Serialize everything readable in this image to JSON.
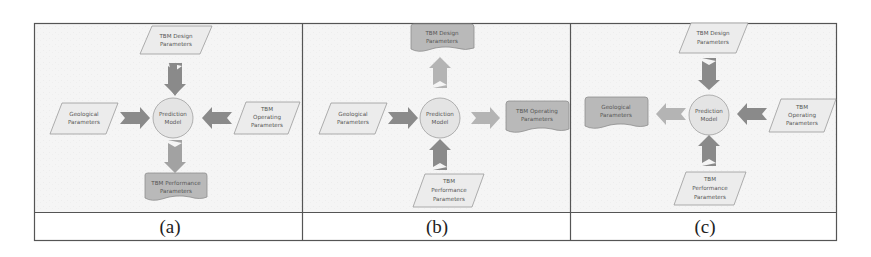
{
  "figure": {
    "colors": {
      "panel_bg": "#f4f4f4",
      "border": "#555555",
      "input_fill": "#ececec",
      "input_stroke": "#9a9a9a",
      "output_fill": "#b9b9b9",
      "output_stroke": "#8e8e8e",
      "circle_fill": "#e4e4e4",
      "arrow_in": "#8a8a8a",
      "arrow_out": "#b4b4b4"
    },
    "panels": [
      {
        "caption": "(a)",
        "center": {
          "label_line1": "Prediction",
          "label_line2": "Model"
        },
        "top": {
          "role": "input",
          "line1": "TBM Design",
          "line2": "Parameters",
          "line3": ""
        },
        "left": {
          "role": "input",
          "line1": "Geological",
          "line2": "Parameters",
          "line3": ""
        },
        "right": {
          "role": "input",
          "line1": "TBM",
          "line2": "Operating",
          "line3": "Parameters"
        },
        "bottom": {
          "role": "output",
          "line1": "TBM Performance",
          "line2": "Parameters",
          "line3": ""
        }
      },
      {
        "caption": "(b)",
        "center": {
          "label_line1": "Prediction",
          "label_line2": "Model"
        },
        "top": {
          "role": "output",
          "line1": "TBM Design",
          "line2": "Parameters",
          "line3": ""
        },
        "left": {
          "role": "input",
          "line1": "Geological",
          "line2": "Parameters",
          "line3": ""
        },
        "right": {
          "role": "output",
          "line1": "TBM Operating",
          "line2": "Parameters",
          "line3": ""
        },
        "bottom": {
          "role": "input",
          "line1": "TBM",
          "line2": "Performance",
          "line3": "Parameters"
        }
      },
      {
        "caption": "(c)",
        "center": {
          "label_line1": "Prediction",
          "label_line2": "Model"
        },
        "top": {
          "role": "input",
          "line1": "TBM Design",
          "line2": "Parameters",
          "line3": ""
        },
        "left": {
          "role": "output",
          "line1": "Geological",
          "line2": "Parameters",
          "line3": ""
        },
        "right": {
          "role": "input",
          "line1": "TBM",
          "line2": "Operating",
          "line3": "Parameters"
        },
        "bottom": {
          "role": "input",
          "line1": "TBM",
          "line2": "Performance",
          "line3": "Parameters"
        }
      }
    ]
  }
}
